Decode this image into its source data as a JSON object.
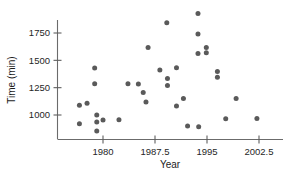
{
  "chart_data": {
    "type": "scatter",
    "title": "",
    "xlabel": "Year",
    "ylabel": "Time (min)",
    "xlim": [
      1976.2,
      2003.8
    ],
    "ylim": [
      880,
      1960
    ],
    "xticks": [
      1980,
      1987.5,
      1995,
      2002.5
    ],
    "xtick_labels": [
      "1980",
      "1987.5",
      "1995",
      "2002.5"
    ],
    "yticks": [
      1000,
      1250,
      1500,
      1750
    ],
    "ytick_labels": [
      "1000",
      "1250",
      "1500",
      "1750"
    ],
    "grid": false,
    "legend": false,
    "marker_color": "#5a5a5a",
    "axis_color": "#6b6b6b",
    "points": [
      {
        "x": 1976.6,
        "y": 1090
      },
      {
        "x": 1976.6,
        "y": 920
      },
      {
        "x": 1977.7,
        "y": 1108
      },
      {
        "x": 1978.8,
        "y": 1430
      },
      {
        "x": 1978.8,
        "y": 1285
      },
      {
        "x": 1979.1,
        "y": 1000
      },
      {
        "x": 1979.1,
        "y": 935
      },
      {
        "x": 1979.1,
        "y": 853
      },
      {
        "x": 1980.0,
        "y": 955
      },
      {
        "x": 1982.3,
        "y": 957
      },
      {
        "x": 1983.6,
        "y": 1285
      },
      {
        "x": 1985.1,
        "y": 1283
      },
      {
        "x": 1985.8,
        "y": 1205
      },
      {
        "x": 1986.2,
        "y": 1120
      },
      {
        "x": 1986.5,
        "y": 1617
      },
      {
        "x": 1988.2,
        "y": 1412
      },
      {
        "x": 1989.2,
        "y": 1843
      },
      {
        "x": 1989.3,
        "y": 1333
      },
      {
        "x": 1989.3,
        "y": 1270
      },
      {
        "x": 1990.6,
        "y": 1432
      },
      {
        "x": 1990.6,
        "y": 1083
      },
      {
        "x": 1991.6,
        "y": 1152
      },
      {
        "x": 1992.2,
        "y": 900
      },
      {
        "x": 1993.7,
        "y": 1928
      },
      {
        "x": 1993.7,
        "y": 1740
      },
      {
        "x": 1993.7,
        "y": 1563
      },
      {
        "x": 1993.8,
        "y": 893
      },
      {
        "x": 1994.9,
        "y": 1617
      },
      {
        "x": 1994.9,
        "y": 1570
      },
      {
        "x": 1996.5,
        "y": 1398
      },
      {
        "x": 1996.5,
        "y": 1345
      },
      {
        "x": 1997.7,
        "y": 965
      },
      {
        "x": 1999.2,
        "y": 1150
      },
      {
        "x": 2002.2,
        "y": 968
      }
    ]
  }
}
